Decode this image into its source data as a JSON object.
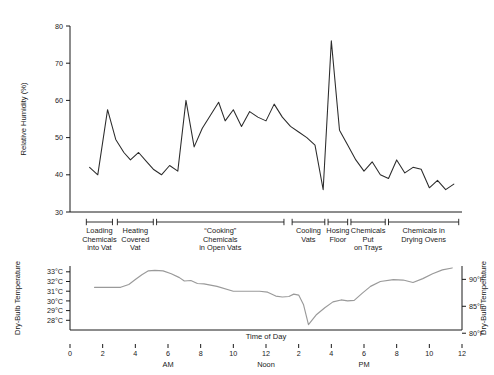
{
  "figure": {
    "background": "#ffffff",
    "humidity_color": "#2b2b2b",
    "temperature_color": "#9a9a9a",
    "axis_color": "#1a1a1a"
  },
  "chart_data": [
    {
      "type": "line",
      "id": "relative-humidity",
      "title": "",
      "ylabel": "Relative Humidity (%)",
      "xlabel": "",
      "ylim": [
        30,
        80
      ],
      "yticks": [
        30,
        40,
        50,
        60,
        70,
        80
      ],
      "ytick_labels": [
        "30",
        "40",
        "50",
        "60",
        "70",
        "80"
      ],
      "xlim": [
        0,
        24
      ],
      "grid": false,
      "legend": "none",
      "series": [
        {
          "name": "Relative Humidity",
          "color": "#2b2b2b",
          "x": [
            1.2,
            1.7,
            2.3,
            2.8,
            3.3,
            3.7,
            4.2,
            4.7,
            5.1,
            5.6,
            6.1,
            6.6,
            7.1,
            7.6,
            8.1,
            8.6,
            9.1,
            9.5,
            10.0,
            10.5,
            11.0,
            11.5,
            12.0,
            12.5,
            13.0,
            13.5,
            14.0,
            14.5,
            15.0,
            15.5,
            16.0,
            16.5,
            17.0,
            17.5,
            18.0,
            18.5,
            19.0,
            19.5,
            20.0,
            20.5,
            21.0,
            21.5,
            22.0,
            22.5,
            23.0,
            23.5
          ],
          "y": [
            42.0,
            40.0,
            57.5,
            49.5,
            46.0,
            44.0,
            46.0,
            43.5,
            41.5,
            40.0,
            42.5,
            41.0,
            60.0,
            47.5,
            52.5,
            56.0,
            59.5,
            54.5,
            57.5,
            53.0,
            57.0,
            55.5,
            54.5,
            59.0,
            55.5,
            53.0,
            51.5,
            50.0,
            48.0,
            36.0,
            76.0,
            52.0,
            48.0,
            44.0,
            41.0,
            43.5,
            40.0,
            39.0,
            44.0,
            40.5,
            42.0,
            41.5,
            36.5,
            38.5,
            36.0,
            37.5
          ]
        }
      ]
    },
    {
      "type": "line",
      "id": "dry-bulb-temperature",
      "title": "",
      "ylabel": "Dry-Bulb Temperature",
      "ylabel_right": "Dry-Bulb Temperature",
      "xlabel": "Time of Day",
      "ylim": [
        27.0,
        33.6
      ],
      "yticks": [
        28,
        29,
        30,
        31,
        32,
        33
      ],
      "ytick_labels": [
        "28°C",
        "29°C",
        "30°C",
        "31°C",
        "32°C",
        "33°C"
      ],
      "yticks_right": [
        80,
        85,
        90
      ],
      "ytick_labels_right": [
        "80°F",
        "85°F",
        "90°F"
      ],
      "xlim": [
        0,
        24
      ],
      "grid": false,
      "legend": "none",
      "series": [
        {
          "name": "Dry-Bulb Temperature",
          "color": "#9a9a9a",
          "x": [
            1.5,
            2.4,
            3.1,
            3.6,
            4.0,
            4.4,
            4.8,
            5.2,
            5.7,
            6.2,
            6.7,
            7.0,
            7.4,
            7.8,
            8.2,
            9.0,
            10.0,
            11.0,
            11.6,
            12.1,
            12.6,
            13.0,
            13.4,
            13.7,
            14.0,
            14.3,
            14.6,
            15.1,
            15.6,
            16.1,
            16.6,
            17.0,
            17.4,
            17.9,
            18.4,
            19.0,
            19.8,
            20.4,
            21.0,
            21.6,
            22.2,
            22.8,
            23.4
          ],
          "y": [
            31.4,
            31.4,
            31.4,
            31.7,
            32.2,
            32.7,
            33.1,
            33.15,
            33.1,
            32.8,
            32.4,
            32.05,
            32.1,
            31.8,
            31.75,
            31.5,
            31.0,
            31.0,
            31.0,
            30.9,
            30.5,
            30.4,
            30.45,
            30.7,
            30.6,
            29.6,
            27.55,
            28.6,
            29.3,
            29.9,
            30.1,
            30.0,
            30.05,
            30.8,
            31.5,
            32.0,
            32.2,
            32.15,
            31.9,
            32.3,
            32.8,
            33.2,
            33.4
          ]
        }
      ],
      "xticks": [
        0,
        2,
        4,
        6,
        8,
        10,
        12,
        14,
        16,
        18,
        20,
        22,
        24
      ],
      "xtick_labels": [
        "0",
        "2",
        "4",
        "6",
        "8",
        "10",
        "12",
        "2",
        "4",
        "6",
        "8",
        "10",
        "12"
      ],
      "xgroups": [
        {
          "label": "AM",
          "at": 6
        },
        {
          "label": "Noon",
          "at": 12
        },
        {
          "label": "PM",
          "at": 18
        }
      ]
    }
  ],
  "phases": {
    "axis_name": "process-phase-axis",
    "items": [
      {
        "label_lines": [
          "Loading",
          "Chemicals",
          "into Vat"
        ],
        "start": 1.0,
        "end": 2.6
      },
      {
        "label_lines": [
          "Heating",
          "Covered",
          "Vat"
        ],
        "start": 2.9,
        "end": 5.1
      },
      {
        "label_lines": [
          "“Cooking”",
          "Chemicals",
          "in Open Vats"
        ],
        "start": 5.3,
        "end": 13.1
      },
      {
        "label_lines": [
          "Cooling",
          "Vats"
        ],
        "start": 13.6,
        "end": 15.6
      },
      {
        "label_lines": [
          "Hosing",
          "Floor"
        ],
        "start": 15.8,
        "end": 17.0
      },
      {
        "label_lines": [
          "Chemicals",
          "Put",
          "on Trays"
        ],
        "start": 17.2,
        "end": 19.3
      },
      {
        "label_lines": [
          "Chemicals in",
          "Drying Ovens"
        ],
        "start": 19.5,
        "end": 23.8
      }
    ]
  }
}
